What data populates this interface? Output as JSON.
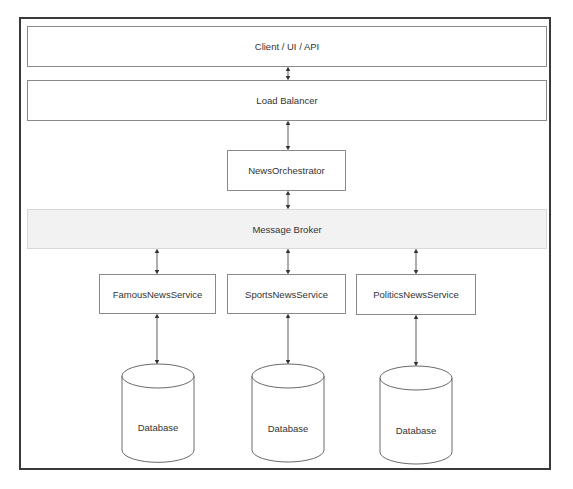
{
  "diagram": {
    "layers": {
      "client": "Client / UI / API",
      "load_balancer": "Load Balancer",
      "orchestrator": "NewsOrchestrator",
      "message_broker": "Message Broker"
    },
    "services": [
      {
        "label": "FamousNewsService",
        "database": "Database"
      },
      {
        "label": "SportsNewsService",
        "database": "Database"
      },
      {
        "label": "PoliticsNewsService",
        "database": "Database"
      }
    ],
    "connections": [
      "Client / UI / API <-> Load Balancer",
      "Load Balancer <-> NewsOrchestrator",
      "NewsOrchestrator <-> Message Broker",
      "Message Broker <-> FamousNewsService",
      "Message Broker <-> SportsNewsService",
      "Message Broker <-> PoliticsNewsService",
      "FamousNewsService <-> Database",
      "SportsNewsService <-> Database",
      "PoliticsNewsService <-> Database"
    ]
  }
}
